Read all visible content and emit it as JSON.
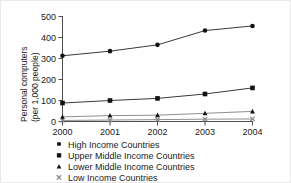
{
  "chart_data": {
    "type": "line",
    "title": "",
    "subtitle": "",
    "xlabel": "",
    "ylabel": "Personal computers (per 1,000 people)",
    "ylabel_line1": "Personal computers",
    "ylabel_line2": "(per 1,000 people)",
    "x": [
      2000,
      2001,
      2002,
      2003,
      2004
    ],
    "categories": [
      "2000",
      "2001",
      "2002",
      "2003",
      "2004"
    ],
    "xlim": [
      2000,
      2004
    ],
    "ylim": [
      0,
      500
    ],
    "yticks": [
      0,
      100,
      200,
      300,
      400,
      500
    ],
    "ytick_labels": [
      "0",
      "100",
      "200",
      "300",
      "400",
      "500"
    ],
    "xticks": [
      2000,
      2001,
      2002,
      2003,
      2004
    ],
    "xtick_labels": [
      "2000",
      "2001",
      "2002",
      "2003",
      "2004"
    ],
    "grid": false,
    "legend_position": "below",
    "series": [
      {
        "name": "High Income Countries",
        "marker": "circle",
        "color": "#121212",
        "line_color": "#3a3a3a",
        "values": [
          313,
          335,
          365,
          433,
          455
        ]
      },
      {
        "name": "Upper Middle Income Countries",
        "marker": "square",
        "color": "#121212",
        "line_color": "#3a3a3a",
        "values": [
          88,
          100,
          110,
          131,
          160
        ]
      },
      {
        "name": "Lower Middle Income Countries",
        "marker": "triangle",
        "color": "#121212",
        "line_color": "#8f8f8f",
        "values": [
          22,
          28,
          30,
          39,
          48
        ]
      },
      {
        "name": "Low Income Countries",
        "marker": "cross",
        "color": "#8a8a8a",
        "line_color": "#8f8f8f",
        "values": [
          5,
          7,
          9,
          11,
          12
        ]
      }
    ]
  },
  "axis": {
    "ytick_0": "0",
    "ytick_1": "100",
    "ytick_2": "200",
    "ytick_3": "300",
    "ytick_4": "400",
    "ytick_5": "500",
    "xtick_0": "2000",
    "xtick_1": "2001",
    "xtick_2": "2002",
    "xtick_3": "2003",
    "xtick_4": "2004",
    "ylabel_line1": "Personal computers",
    "ylabel_line2": "(per 1,000 people)"
  },
  "legend": {
    "item_0": "High Income Countries",
    "item_1": "Upper Middle Income Countries",
    "item_2": "Lower Middle Income Countries",
    "item_3": "Low Income Countries"
  }
}
